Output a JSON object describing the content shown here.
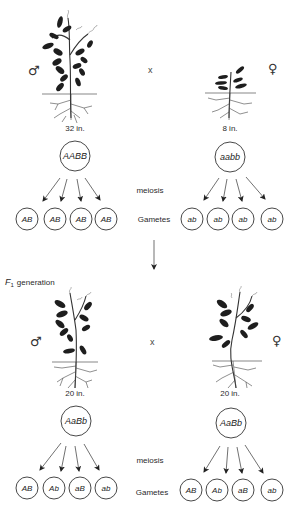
{
  "parents": {
    "male": {
      "symbol": "♂",
      "height_label": "32 in.",
      "genotype": "AABB",
      "gametes": [
        "AB",
        "AB",
        "AB",
        "AB"
      ]
    },
    "cross_symbol": "x",
    "female": {
      "symbol": "♀",
      "height_label": "8 in.",
      "genotype": "aabb",
      "gametes": [
        "ab",
        "ab",
        "ab",
        "ab"
      ]
    },
    "meiosis_label": "meiosis",
    "gametes_label": "Gametes"
  },
  "f1": {
    "title_prefix": "F",
    "title_subscript": "1",
    "title_suffix": "generation",
    "male": {
      "symbol": "♂",
      "height_label": "20 in.",
      "genotype": "AaBb",
      "gametes": [
        "AB",
        "Ab",
        "aB",
        "ab"
      ]
    },
    "cross_symbol": "x",
    "female": {
      "symbol": "♀",
      "height_label": "20 in.",
      "genotype": "AaBb",
      "gametes": [
        "AB",
        "Ab",
        "aB",
        "ab"
      ]
    },
    "meiosis_label": "meiosis",
    "gametes_label": "Gametes"
  }
}
